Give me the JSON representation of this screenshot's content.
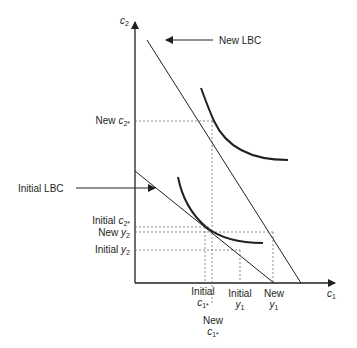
{
  "diagram": {
    "axes": {
      "x": {
        "var": "c",
        "sub": "1"
      },
      "y": {
        "var": "c",
        "sub": "2"
      }
    },
    "callouts": {
      "new_lbc": "New LBC",
      "initial_lbc": "Initial LBC"
    },
    "y_labels": {
      "new_c2_star": {
        "prefix": "New ",
        "var": "c",
        "sub": "2*"
      },
      "initial_c2_star": {
        "prefix": "Initial ",
        "var": "c",
        "sub": "2*"
      },
      "new_y2": {
        "prefix": "New ",
        "var": "y",
        "sub": "2"
      },
      "initial_y2": {
        "prefix": "Initial ",
        "var": "y",
        "sub": "2"
      }
    },
    "x_labels": {
      "initial_c1_star": {
        "line1": "Initial",
        "var": "c",
        "sub": "1*"
      },
      "initial_y1": {
        "line1": "Initial",
        "var": "y",
        "sub": "1"
      },
      "new_y1": {
        "line1": "New",
        "var": "y",
        "sub": "1"
      },
      "new_c1_star": {
        "line1": "New",
        "var": "c",
        "sub": "1*"
      }
    },
    "colors": {
      "ink": "#231f20",
      "dash": "#6d6e71"
    }
  }
}
